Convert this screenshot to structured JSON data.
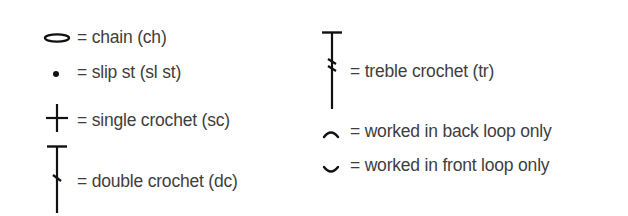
{
  "legend": {
    "left_column": [
      {
        "symbol": "chain-oval",
        "label": "= chain (ch)"
      },
      {
        "symbol": "slip-stitch-dot",
        "label": "= slip st (sl st)"
      },
      {
        "symbol": "single-crochet-cross",
        "label": "= single crochet (sc)"
      },
      {
        "symbol": "double-crochet-one-slash",
        "label": "= double crochet (dc)"
      }
    ],
    "right_column": [
      {
        "symbol": "treble-crochet-two-slashes",
        "label": "= treble crochet (tr)"
      },
      {
        "symbol": "back-loop-arc",
        "label": "= worked in back loop only"
      },
      {
        "symbol": "front-loop-arc",
        "label": "= worked in front loop only"
      }
    ]
  },
  "colors": {
    "symbol": "#111111",
    "text": "#3e3e3e",
    "background": "#ffffff"
  }
}
